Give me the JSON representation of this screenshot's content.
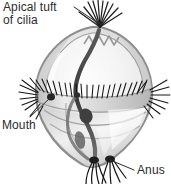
{
  "figure": {
    "background_color": "#ffffff",
    "line_color": "#2b2b2b",
    "body_fill_color": "#d8d8d8",
    "body_outline_color": "#8a8a8a",
    "cilia_color": "#1c1c1c",
    "gut_color": "#4a4a4a"
  },
  "labels": {
    "apical": {
      "line1": "Apical tuft",
      "line2": "of cilia"
    },
    "mouth": {
      "text": "Mouth"
    },
    "anus": {
      "text": "Anus"
    }
  },
  "leaders": {
    "apical": {
      "x1": 74,
      "y1": 7,
      "x2": 101,
      "y2": 25
    },
    "mouth": {
      "x1": 30,
      "y1": 117,
      "x2": 51,
      "y2": 97
    },
    "anus": {
      "x1": 134,
      "y1": 170,
      "x2": 110,
      "y2": 160
    }
  },
  "anatomy": {
    "apical_tuft": "apical-tuft-of-cilia",
    "prototroch": "equatorial-ciliary-band",
    "mouth": "mouth-opening",
    "anus": "anus-opening",
    "gut": "digestive-tract",
    "body": "larval-body"
  }
}
